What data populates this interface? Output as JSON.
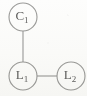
{
  "diagram": {
    "type": "graph",
    "title": "",
    "background_color": "#fdfdfc",
    "stroke_color": "#9a9a98",
    "label_color": "#5d5d5c",
    "nodes": [
      {
        "id": "C1",
        "label_base": "C",
        "label_sub": "1",
        "label_full": "C1",
        "cx": 23,
        "cy": 17,
        "r": 14
      },
      {
        "id": "L1",
        "label_base": "L",
        "label_sub": "1",
        "label_full": "L1",
        "cx": 23,
        "cy": 76,
        "r": 14
      },
      {
        "id": "L2",
        "label_base": "L",
        "label_sub": "2",
        "label_full": "L2",
        "cx": 71,
        "cy": 76,
        "r": 14
      }
    ],
    "edges": [
      {
        "id": "edge-c1-l1",
        "from": "C1",
        "to": "L1",
        "orientation": "vertical",
        "x1": 23,
        "y1": 31,
        "x2": 23,
        "y2": 62
      },
      {
        "id": "edge-l1-l2",
        "from": "L1",
        "to": "L2",
        "orientation": "horizontal",
        "x1": 37,
        "y1": 76,
        "x2": 57,
        "y2": 76
      }
    ]
  }
}
